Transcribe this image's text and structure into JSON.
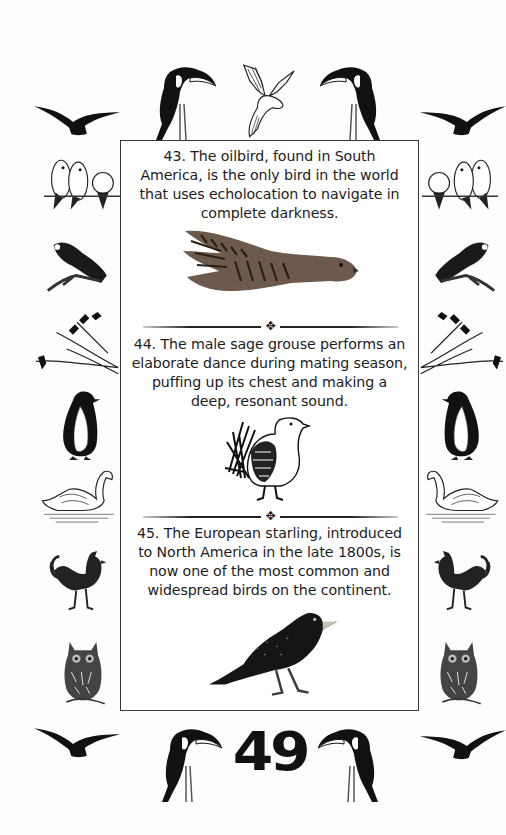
{
  "page": {
    "background": "#fdfdfd",
    "border_color": "#3a3a3a",
    "text_color": "#1c1c1c",
    "page_number": "49"
  },
  "facts": [
    {
      "number": "43",
      "text": "43. The oilbird, found in South America, is the only bird in the world that uses echolocation to navigate in complete darkness.",
      "illustration": "oilbird-illustration"
    },
    {
      "number": "44",
      "text": "44. The male sage grouse performs an elaborate dance during mating season, puffing up its chest and making a deep, resonant sound.",
      "illustration": "sage-grouse-illustration"
    },
    {
      "number": "45",
      "text": "45. The European starling, introduced to North America in the late 1800s, is now one of the most common and widespread birds on the continent.",
      "illustration": "starling-illustration"
    }
  ],
  "separator": {
    "ornament": "✥"
  },
  "border_decorations": {
    "top": [
      "flying-bird-silhouette",
      "toucan",
      "dove",
      "toucan",
      "flying-bird-silhouette"
    ],
    "left": [
      "lovebirds",
      "parrot-on-branch",
      "birds-on-branches",
      "penguin",
      "swan",
      "rooster",
      "owl"
    ],
    "right": [
      "lovebirds",
      "parrot-on-branch",
      "birds-on-branches",
      "penguin",
      "swan",
      "rooster",
      "owl"
    ],
    "bottom": [
      "flying-bird-silhouette",
      "toucan",
      "toucan",
      "flying-bird-silhouette"
    ]
  }
}
